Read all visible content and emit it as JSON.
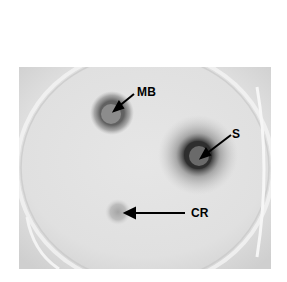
{
  "figure": {
    "labels": {
      "mb": "MB",
      "s": "S",
      "cr": "CR"
    },
    "colors": {
      "background": "#ffffff",
      "agar": "#e2e2e2",
      "spot_dark": "#3a3a3a",
      "label": "#000000"
    }
  }
}
